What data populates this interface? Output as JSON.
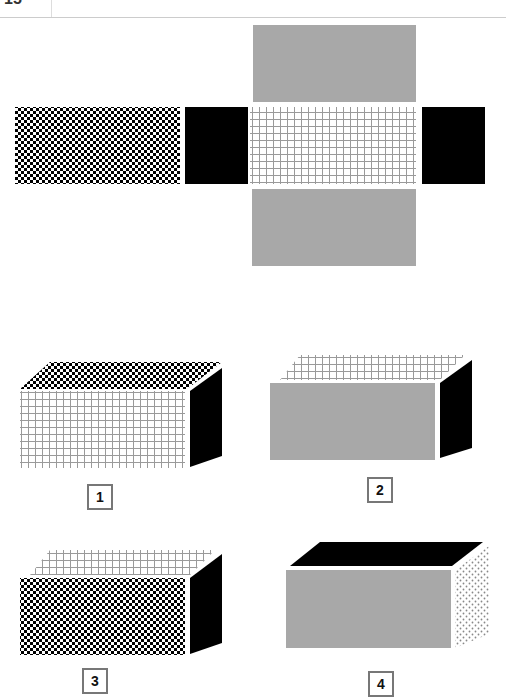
{
  "question_number": "15",
  "watermark": "CopyrightMind",
  "net": {
    "faces": [
      {
        "name": "left-end",
        "pattern": "checker"
      },
      {
        "name": "left-side",
        "pattern": "black"
      },
      {
        "name": "center",
        "pattern": "grid"
      },
      {
        "name": "right-side",
        "pattern": "black"
      },
      {
        "name": "top",
        "pattern": "gray"
      },
      {
        "name": "bottom",
        "pattern": "gray"
      }
    ]
  },
  "options": [
    {
      "label": "1",
      "front": "grid",
      "top": "checker",
      "side": "black"
    },
    {
      "label": "2",
      "front": "gray",
      "top": "grid",
      "side": "black"
    },
    {
      "label": "3",
      "front": "checker",
      "top": "grid",
      "side": "black"
    },
    {
      "label": "4",
      "front": "gray",
      "top": "black",
      "side": "dots"
    }
  ],
  "colors": {
    "gray": "#a8a8a8",
    "black": "#000000",
    "grid_line": "#9a9a9a",
    "border": "#777777"
  }
}
